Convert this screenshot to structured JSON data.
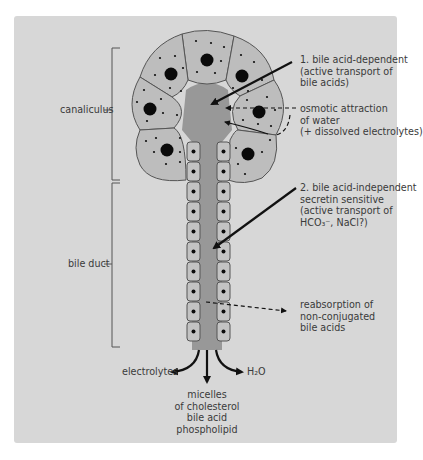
{
  "diagram": {
    "type": "bile formation and secretion schematic",
    "colors": {
      "background_panel": "#d7d7d7",
      "hepatocyte": "#bdbdbd",
      "lumen": "#989898",
      "duct_cell": "#c3c3c3",
      "nucleus": "#0a0a0a",
      "outline": "#555555",
      "arrow": "#111111"
    },
    "brackets": {
      "canaliculus": "canaliculus",
      "bile_duct": "bile duct"
    },
    "annotations": {
      "bile_acid_dependent": [
        "1. bile acid-dependent",
        "(active transport of",
        "bile acids)"
      ],
      "osmotic": [
        "osmotic attraction",
        "of water",
        "(+ dissolved electrolytes)"
      ],
      "bile_acid_independent": [
        "2. bile acid-independent",
        "secretin sensitive",
        "(active transport of",
        "HCO₃⁻, NaCl?)"
      ],
      "reabsorption": [
        "reabsorption of",
        "non-conjugated",
        "bile acids"
      ]
    },
    "outputs": {
      "electrolytes": "electrolytes",
      "water": "H₂O",
      "micelles": [
        "micelles",
        "of cholesterol",
        "bile acid",
        "phospholipid"
      ]
    }
  }
}
